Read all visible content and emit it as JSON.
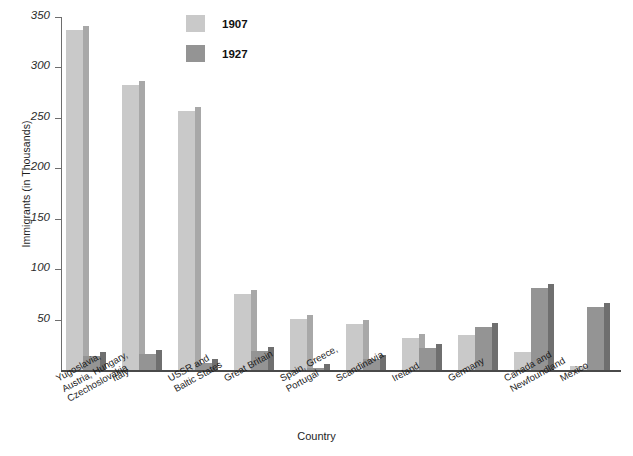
{
  "chart_data": {
    "type": "bar",
    "title": "",
    "xlabel": "Country",
    "ylabel": "Immigrants (in Thousands)",
    "ylim": [
      0,
      350
    ],
    "ytick_values": [
      0,
      50,
      100,
      150,
      200,
      250,
      300,
      350
    ],
    "ytick_labels": [
      "",
      "50",
      "100",
      "150",
      "200",
      "250",
      "300",
      "350"
    ],
    "grid": false,
    "legend_position": "top-center",
    "categories": [
      "Yugoslavia,\nAustria, Hungary,\nCzechoslovakia",
      "Italy",
      "USSR and\nBaltic States",
      "Great Britain",
      "Spain, Greece,\nPortugal",
      "Scandinavia",
      "Ireland",
      "Germany",
      "Canada and\nNewfoundland",
      "Mexico"
    ],
    "series": [
      {
        "name": "1907",
        "color": "#c9c9c9",
        "side_color": "#a8a8a8",
        "values": [
          337,
          283,
          257,
          75,
          51,
          46,
          32,
          35,
          18,
          4
        ]
      },
      {
        "name": "1927",
        "color": "#949494",
        "side_color": "#6f6f6f",
        "values": [
          14,
          16,
          7,
          19,
          2,
          11,
          22,
          43,
          81,
          62
        ]
      }
    ]
  },
  "legend": {
    "entries": [
      {
        "label": "1907",
        "color": "#c9c9c9"
      },
      {
        "label": "1927",
        "color": "#949494"
      }
    ]
  },
  "axes": {
    "x_title": "Country",
    "y_title": "Immigrants (in Thousands)"
  }
}
